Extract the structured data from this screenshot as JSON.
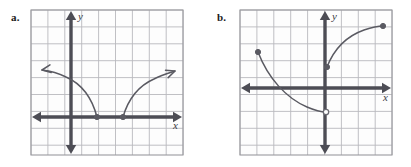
{
  "page": {
    "background": "#ffffff",
    "width": 411,
    "height": 167,
    "grid_color": "#b9b9bd",
    "grid_border_color": "#9a9a9e",
    "axis_color": "#4d4d55",
    "curve_color": "#5a5a62"
  },
  "panels": [
    {
      "id": "a",
      "label": "a.",
      "label_pos": {
        "x": 11,
        "y": 11
      },
      "grid": {
        "x": 31,
        "y": 10,
        "width": 152,
        "height": 145,
        "cell": 16.9,
        "cols": 9,
        "rows": 8.6,
        "show_border": true
      },
      "axes": {
        "origin": {
          "x": 71,
          "y": 117
        },
        "x_axis": {
          "label": "x",
          "label_pos": {
            "x": 173,
            "y": 129
          },
          "from_x": 34,
          "to_x": 180,
          "arrows": "both"
        },
        "y_axis": {
          "label": "y",
          "label_pos": {
            "x": 78,
            "y": 20
          },
          "from_y": 13,
          "to_y": 152,
          "arrows": "both"
        }
      },
      "points": [
        {
          "x": 97,
          "y": 117,
          "type": "filled",
          "name": "left-branch-endpoint"
        },
        {
          "x": 123,
          "y": 117,
          "type": "filled",
          "name": "right-branch-endpoint"
        }
      ],
      "curves": [
        {
          "name": "left-branch",
          "path": "M 97 117 C 92 98 82 84 66 77 C 58 73 50 71 42 70",
          "arrow_at": "end",
          "arrow_angle": -189
        },
        {
          "name": "right-branch",
          "path": "M 123 117 C 128 100 138 86 154 79 C 162 75 169 73 175 71",
          "arrow_at": "end",
          "arrow_angle": -20
        }
      ]
    },
    {
      "id": "b",
      "label": "b.",
      "label_pos": {
        "x": 11,
        "y": 11
      },
      "grid": {
        "x": 34,
        "y": 10,
        "width": 152,
        "height": 145,
        "cell": 16.9,
        "cols": 9,
        "rows": 8.6,
        "show_border": true
      },
      "axes": {
        "origin": {
          "x": 119,
          "y": 88
        },
        "x_axis": {
          "label": "x",
          "label_pos": {
            "x": 177,
            "y": 101
          },
          "from_x": 37,
          "to_x": 183,
          "arrows": "both"
        },
        "y_axis": {
          "label": "y",
          "label_pos": {
            "x": 126,
            "y": 20
          },
          "from_y": 13,
          "to_y": 152,
          "arrows": "both"
        }
      },
      "points": [
        {
          "x": 52,
          "y": 52,
          "type": "filled",
          "name": "upper-left-endpoint"
        },
        {
          "x": 120,
          "y": 112,
          "type": "open",
          "name": "open-endpoint"
        },
        {
          "x": 121,
          "y": 67,
          "type": "filled",
          "name": "lower-right-endpoint"
        },
        {
          "x": 177,
          "y": 26,
          "type": "filled",
          "name": "upper-right-endpoint"
        }
      ],
      "curves": [
        {
          "name": "decreasing-branch",
          "path": "M 52 52 C 62 78 80 98 101 107 C 108 110 114 112 120 112",
          "arrow_at": "none",
          "arrow_angle": 0
        },
        {
          "name": "increasing-branch",
          "path": "M 121 67 C 128 49 141 36 158 30 C 164 28 171 26 177 26",
          "arrow_at": "none",
          "arrow_angle": 0
        }
      ]
    }
  ]
}
